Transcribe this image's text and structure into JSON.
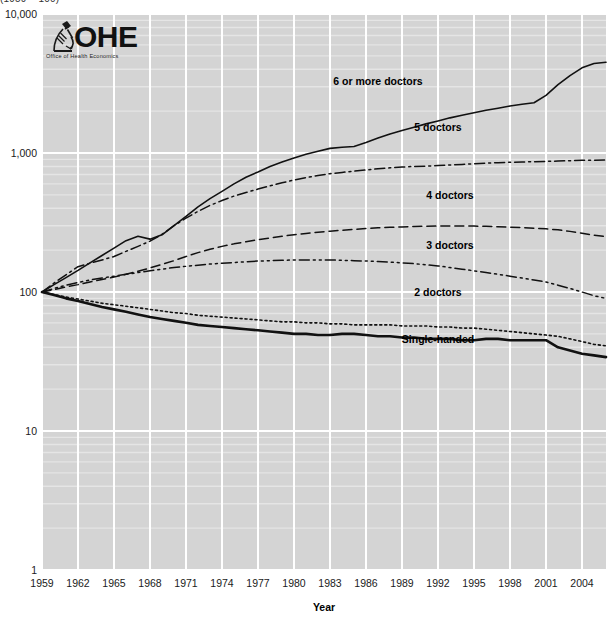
{
  "clipped_title": "(1959 = 100)",
  "logo": {
    "name": "OHE",
    "subtitle": "Office of Health Economics",
    "icon": "microscope-icon"
  },
  "colors": {
    "plot_background": "#d4d4d4",
    "gridline": "#ffffff",
    "minor_gridline": "#e8e8e8",
    "line": "#111111",
    "text": "#1a1a1a"
  },
  "chart_data": {
    "type": "line",
    "title": "",
    "xlabel": "Year",
    "ylabel": "",
    "log_y": true,
    "ylim": [
      1,
      10000
    ],
    "xlim": [
      1959,
      2006
    ],
    "grid": true,
    "legend_position": "inline-right",
    "ytick_labels": [
      "10,000",
      "1,000",
      "100",
      "10",
      "1"
    ],
    "ytick_values": [
      10000,
      1000,
      100,
      10,
      1
    ],
    "xtick_labels": [
      "1959",
      "1962",
      "1965",
      "1968",
      "1971",
      "1974",
      "1977",
      "1980",
      "1983",
      "1986",
      "1989",
      "1992",
      "1995",
      "1998",
      "2001",
      "2004"
    ],
    "xtick_values": [
      1959,
      1962,
      1965,
      1968,
      1971,
      1974,
      1977,
      1980,
      1983,
      1986,
      1989,
      1992,
      1995,
      1998,
      2001,
      2004
    ],
    "x": [
      1959,
      1960,
      1961,
      1962,
      1963,
      1964,
      1965,
      1966,
      1967,
      1968,
      1969,
      1970,
      1971,
      1972,
      1973,
      1974,
      1975,
      1976,
      1977,
      1978,
      1979,
      1980,
      1981,
      1982,
      1983,
      1984,
      1985,
      1986,
      1987,
      1988,
      1989,
      1990,
      1991,
      1992,
      1993,
      1994,
      1995,
      1996,
      1997,
      1998,
      1999,
      2000,
      2001,
      2002,
      2003,
      2004,
      2005,
      2006
    ],
    "series": [
      {
        "name": "6 or more doctors",
        "label": "6 or more doctors",
        "style": "solid",
        "width": 1.6,
        "label_x": 1987,
        "label_y": 3100,
        "values": [
          100,
          113,
          127,
          143,
          162,
          183,
          207,
          234,
          252,
          240,
          258,
          300,
          350,
          410,
          470,
          530,
          600,
          670,
          730,
          800,
          860,
          920,
          980,
          1030,
          1080,
          1100,
          1115,
          1190,
          1280,
          1370,
          1450,
          1530,
          1620,
          1700,
          1790,
          1870,
          1950,
          2030,
          2100,
          2180,
          2240,
          2300,
          2600,
          3100,
          3600,
          4100,
          4400,
          4500
        ]
      },
      {
        "name": "5 doctors",
        "label": "5 doctors",
        "style": "dash-dot",
        "width": 1.5,
        "label_x": 1992,
        "label_y": 1450,
        "values": [
          100,
          116,
          133,
          152,
          161,
          170,
          180,
          196,
          213,
          232,
          260,
          300,
          340,
          380,
          420,
          455,
          490,
          520,
          550,
          580,
          610,
          640,
          665,
          690,
          710,
          725,
          740,
          755,
          770,
          782,
          793,
          800,
          805,
          812,
          820,
          828,
          836,
          845,
          852,
          858,
          862,
          866,
          870,
          875,
          880,
          885,
          888,
          890
        ]
      },
      {
        "name": "4 doctors",
        "label": "4 doctors",
        "style": "dashed",
        "width": 1.5,
        "label_x": 1993,
        "label_y": 470,
        "values": [
          100,
          104,
          109,
          113,
          118,
          123,
          128,
          134,
          141,
          149,
          158,
          168,
          180,
          192,
          203,
          213,
          222,
          230,
          238,
          245,
          252,
          258,
          264,
          269,
          274,
          278,
          282,
          286,
          290,
          292,
          294,
          296,
          297,
          298,
          299,
          299,
          298,
          297,
          295,
          293,
          291,
          288,
          285,
          280,
          273,
          265,
          256,
          250
        ]
      },
      {
        "name": "3 doctors",
        "label": "3 doctors",
        "style": "dash-dot-dot",
        "width": 1.5,
        "label_x": 1993,
        "label_y": 205,
        "values": [
          100,
          106,
          112,
          117,
          122,
          126,
          130,
          134,
          138,
          142,
          146,
          150,
          153,
          156,
          159,
          161,
          163,
          165,
          167,
          168,
          169,
          170,
          170,
          170,
          170,
          169,
          168,
          167,
          166,
          164,
          162,
          160,
          157,
          154,
          150,
          146,
          142,
          138,
          134,
          130,
          126,
          122,
          118,
          112,
          106,
          100,
          94,
          90
        ]
      },
      {
        "name": "2 doctors",
        "label": "2 doctors",
        "style": "dotted",
        "width": 1.6,
        "label_x": 1992,
        "label_y": 93,
        "values": [
          100,
          96,
          92,
          89,
          86,
          83,
          81,
          79,
          77,
          75,
          73,
          71,
          70,
          68,
          67,
          66,
          65,
          64,
          63,
          62,
          61,
          61,
          60,
          60,
          59,
          59,
          58,
          58,
          58,
          58,
          57,
          57,
          57,
          56,
          56,
          55,
          55,
          54,
          53,
          52,
          51,
          50,
          49,
          48,
          46,
          44,
          42,
          41
        ]
      },
      {
        "name": "Single-handed",
        "label": "Single-handed",
        "style": "solid-thick",
        "width": 2.6,
        "label_x": 1992,
        "label_y": 43,
        "values": [
          100,
          95,
          90,
          86,
          82,
          78,
          75,
          72,
          69,
          66,
          64,
          62,
          60,
          58,
          57,
          56,
          55,
          54,
          53,
          52,
          51,
          50,
          50,
          49,
          49,
          50,
          50,
          49,
          48,
          48,
          47,
          47,
          46,
          46,
          46,
          45,
          45,
          46,
          46,
          45,
          45,
          45,
          45,
          40,
          38,
          36,
          35,
          34
        ]
      }
    ]
  }
}
